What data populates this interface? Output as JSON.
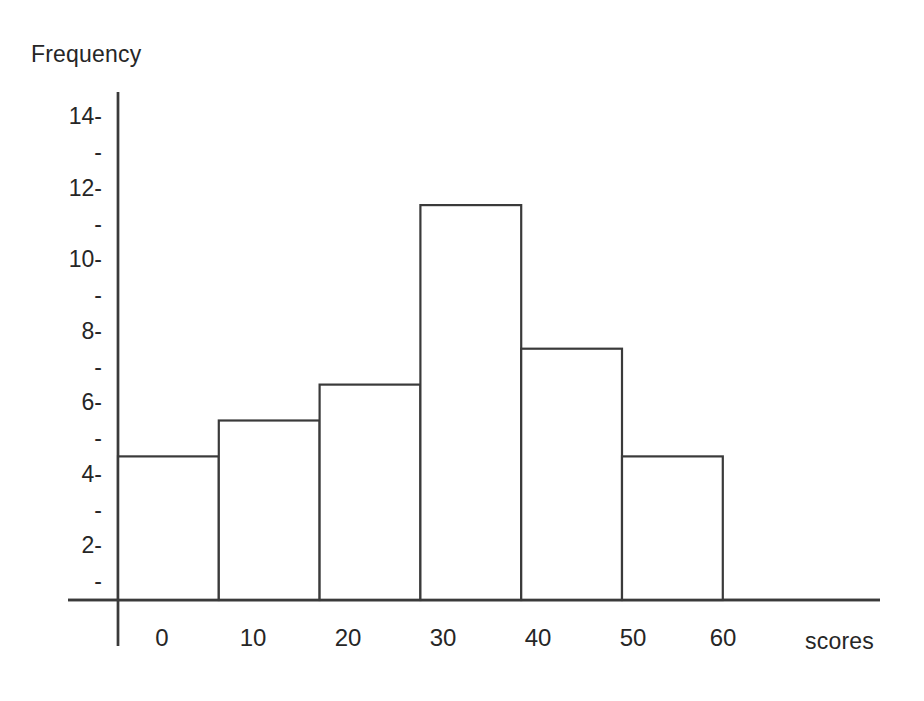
{
  "chart_data": {
    "type": "bar",
    "title": "",
    "subtitle": "",
    "xlabel": "scores",
    "ylabel": "Frequency",
    "bin_edges": [
      0,
      10,
      20,
      30,
      40,
      50,
      60
    ],
    "categories": [
      "0-10",
      "10-20",
      "20-30",
      "30-40",
      "40-50",
      "50-60"
    ],
    "values": [
      4,
      5,
      6,
      11,
      7,
      4
    ],
    "x_tick_labels": [
      "0",
      "10",
      "20",
      "30",
      "40",
      "50",
      "60"
    ],
    "y_tick_labels": [
      "2",
      "4",
      "6",
      "8",
      "10",
      "12",
      "14"
    ],
    "y_minor_tick_labels": [
      "-",
      "-",
      "-",
      "-",
      "-",
      "-",
      "-"
    ],
    "ylim": [
      0,
      15
    ],
    "xlim": [
      0,
      60
    ],
    "grid": false,
    "legend": null,
    "bar_fill": "#ffffff",
    "bar_stroke": "#3a3a3a",
    "axis_color": "#3a3a3a",
    "text_color": "#262626",
    "background": "#ffffff"
  },
  "labels": {
    "y_axis_title": "Frequency",
    "x_axis_title": "scores",
    "y_ticks": {
      "t14": "14-",
      "t13": "-",
      "t12": "12-",
      "t11": "-",
      "t10": "10-",
      "t9": "-",
      "t8": "8-",
      "t7": "-",
      "t6": "6-",
      "t5": "-",
      "t4": "4-",
      "t3": "-",
      "t2": "2-",
      "t1": "-"
    },
    "x_ticks": {
      "x0": "0",
      "x10": "10",
      "x20": "20",
      "x30": "30",
      "x40": "40",
      "x50": "50",
      "x60": "60"
    }
  }
}
